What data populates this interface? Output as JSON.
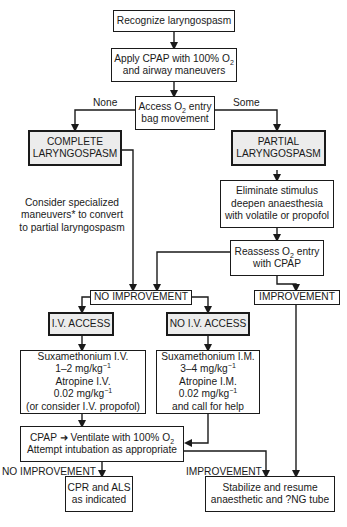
{
  "diagram": {
    "type": "flowchart",
    "nodes": {
      "recognize": {
        "line1": "Recognize laryngospasm"
      },
      "apply_cpap": {
        "line1": "Apply CPAP with 100% O",
        "line1_sub": "2",
        "line2": "and airway maneuvers"
      },
      "assess": {
        "line1a": "Access O",
        "line1_sub": "2",
        "line1b": " entry",
        "line2": "bag movement"
      },
      "complete": {
        "line1": "COMPLETE",
        "line2": "LARYNGOSPASM"
      },
      "partial": {
        "line1": "PARTIAL",
        "line2": "LARYNGOSPASM"
      },
      "consider_note": {
        "line1": "Consider specialized",
        "line2": "maneuvers* to convert",
        "line3": "to partial laryngospasm"
      },
      "eliminate": {
        "line1": "Eliminate stimulus",
        "line2": "deepen anaesthesia",
        "line3": "with volatile or propofol"
      },
      "reassess": {
        "line1a": "Reassess O",
        "line1_sub": "2",
        "line1b": " entry",
        "line2": "with CPAP"
      },
      "no_improvement": {
        "line1": "NO IMPROVEMENT"
      },
      "improvement": {
        "line1": "IMPROVEMENT"
      },
      "iv_access": {
        "line1": "I.V. ACCESS"
      },
      "no_iv_access": {
        "line1": "NO I.V. ACCESS"
      },
      "iv_drugs": {
        "line1": "Suxamethonium I.V.",
        "line2a": "1–2 mg/kg",
        "line2_sup": "−1",
        "line3": "Atropine I.V.",
        "line4a": "0.02 mg/kg",
        "line4_sup": "−1",
        "line5": "(or consider I.V. propofol)"
      },
      "im_drugs": {
        "line1": "Suxamethonium I.M.",
        "line2a": "3–4 mg/kg",
        "line2_sup": "−1",
        "line3": "Atropine I.M.",
        "line4a": "0.02 mg/kg",
        "line4_sup": "−1",
        "line5": "and call for help"
      },
      "ventilate": {
        "line1a": "CPAP",
        "line1_arrow": "➜",
        "line1b": " Ventilate with 100% O",
        "line1_sub": "2",
        "line2": "Attempt intubation as appropriate"
      },
      "cpr": {
        "line1": "CPR and ALS",
        "line2": "as indicated"
      },
      "stabilize": {
        "line1": "Stabilize and resume",
        "line2": "anaesthetic and ?NG tube"
      }
    },
    "edge_labels": {
      "none": "None",
      "some": "Some",
      "no_improvement_bottom": "NO IMPROVEMENT",
      "improvement_bottom": "IMPROVEMENT"
    },
    "colors": {
      "line": "#1a1a1a",
      "shaded_fill": "#ececec",
      "background": "#ffffff"
    }
  }
}
